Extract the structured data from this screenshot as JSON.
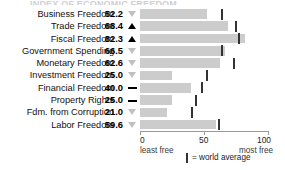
{
  "title_sliver": "INDEX OF ECONOMIC FREEDOM",
  "legend": {
    "marker_name": "world-average-marker",
    "text": "= world average"
  },
  "axis": {
    "ticks": [
      {
        "value": 0,
        "label": "0"
      },
      {
        "value": 50,
        "label": "50"
      },
      {
        "value": 100,
        "label": "100"
      }
    ],
    "left_end_label": "least free",
    "right_end_label": "most free"
  },
  "colors": {
    "bar": "#cccccc",
    "marker": "#333333",
    "up_triangle": "#000000",
    "down_triangle": "#bfbfc4",
    "axis": "#9a9a9a",
    "text": "#111111"
  },
  "chart_data": {
    "type": "bar",
    "title": "Index of Economic Freedom",
    "xlabel": "",
    "ylabel": "",
    "xlim": [
      0,
      100
    ],
    "grid": false,
    "orientation": "horizontal",
    "legend_position": "bottom-right",
    "categories": [
      "Business Freedom",
      "Trade Freedom",
      "Fiscal Freedom",
      "Government Spending",
      "Monetary Freedom",
      "Investment Freedom",
      "Financial Freedom",
      "Property Rights",
      "Fdm. from Corruption",
      "Labor Freedom"
    ],
    "values": [
      52.2,
      68.4,
      82.3,
      66.5,
      62.6,
      25.0,
      40.0,
      25.0,
      21.0,
      59.6
    ],
    "value_labels": [
      "52.2",
      "68.4",
      "82.3",
      "66.5",
      "62.6",
      "25.0",
      "40.0",
      "25.0",
      "21.0",
      "59.6"
    ],
    "trends": [
      "down",
      "up",
      "up",
      "down",
      "down",
      "down",
      "flat",
      "flat",
      "down",
      "down"
    ],
    "world_average": [
      64.3,
      74.8,
      77.1,
      63.9,
      73.4,
      52.0,
      48.5,
      43.6,
      40.5,
      61.5
    ],
    "series": [
      {
        "name": "Country score",
        "values": [
          52.2,
          68.4,
          82.3,
          66.5,
          62.6,
          25.0,
          40.0,
          25.0,
          21.0,
          59.6
        ]
      },
      {
        "name": "World average",
        "values": [
          64.3,
          74.8,
          77.1,
          63.9,
          73.4,
          52.0,
          48.5,
          43.6,
          40.5,
          61.5
        ]
      }
    ]
  }
}
